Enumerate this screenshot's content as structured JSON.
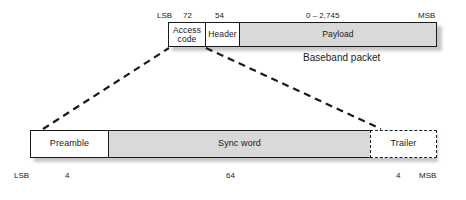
{
  "figure": {
    "caption": "Baseband packet"
  },
  "packet": {
    "segments": [
      {
        "label": "Access code",
        "bits": "72",
        "fill": "white"
      },
      {
        "label": "Header",
        "bits": "54",
        "fill": "white"
      },
      {
        "label": "Payload",
        "bits": "0 – 2,745",
        "fill": "gray"
      }
    ],
    "lsb_label": "LSB",
    "msb_label": "MSB"
  },
  "access_code": {
    "segments": [
      {
        "label": "Preamble",
        "bits": "4",
        "fill": "white",
        "border": "solid"
      },
      {
        "label": "Sync word",
        "bits": "64",
        "fill": "gray",
        "border": "solid"
      },
      {
        "label": "Trailer",
        "bits": "4",
        "fill": "white",
        "border": "dashed"
      }
    ],
    "lsb_label": "LSB",
    "msb_label": "MSB"
  },
  "colors": {
    "outline": "#1a1a1a",
    "fill_gray": "#d9d9d9",
    "fill_white": "#ffffff",
    "shadow": "#9b9b9b"
  }
}
